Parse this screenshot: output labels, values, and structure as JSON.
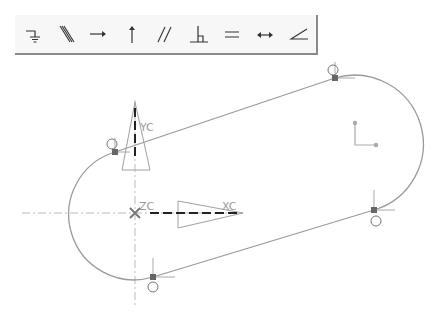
{
  "toolbar": {
    "tools": [
      {
        "name": "fixed-constraint",
        "icon": "fixed-icon"
      },
      {
        "name": "collinear-constraint",
        "icon": "collinear-icon"
      },
      {
        "name": "horizontal-constraint",
        "icon": "horizontal-icon"
      },
      {
        "name": "vertical-constraint",
        "icon": "vertical-icon"
      },
      {
        "name": "parallel-constraint",
        "icon": "parallel-icon"
      },
      {
        "name": "perpendicular-constraint",
        "icon": "perpendicular-icon"
      },
      {
        "name": "equal-length-constraint",
        "icon": "equal-icon"
      },
      {
        "name": "constant-length-constraint",
        "icon": "length-icon"
      },
      {
        "name": "constant-angle-constraint",
        "icon": "angle-icon"
      }
    ]
  },
  "sketch": {
    "axis_labels": {
      "y": "YC",
      "z": "ZC",
      "x": "XC"
    },
    "colors": {
      "curve": "#9a9a9a",
      "axis": "#b8b8b8",
      "triad": "#aaaaaa",
      "dashed": "#222222",
      "point": "#666666"
    }
  }
}
